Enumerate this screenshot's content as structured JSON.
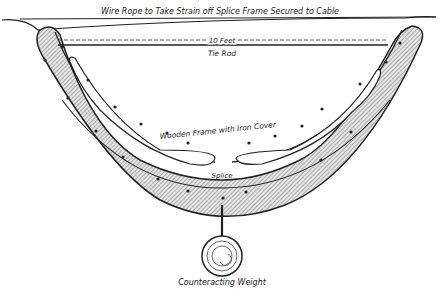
{
  "diagram": {
    "labels": {
      "wire_rope": "Wire Rope to Take Strain off Splice Frame Secured to Cable",
      "length": "10 Feet",
      "tie_rod": "Tie Rod",
      "frame": "Wooden Frame with Iron Cover",
      "splice": "Splice",
      "weight": "Counteracting Weight"
    },
    "colors": {
      "ink": "#222222",
      "hatch_fill": "#bdbdbd",
      "background": "#ffffff"
    }
  }
}
